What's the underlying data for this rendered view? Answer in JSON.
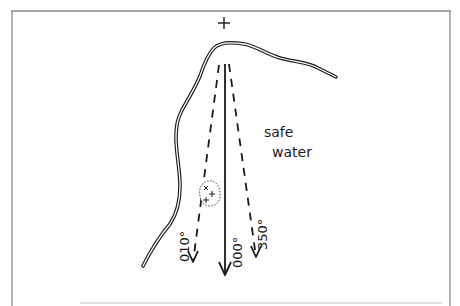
{
  "diagram": {
    "type": "clearing bearing / danger bearing chart sketch",
    "labels": {
      "water": [
        "safe",
        "water"
      ],
      "bearing_left": "010°",
      "bearing_center": "000°",
      "bearing_right": "350°",
      "landmark_symbol": "+"
    },
    "colors": {
      "ink": "#1a1a1a",
      "frame": "#8a8a8a",
      "background": "#ffffff"
    }
  }
}
